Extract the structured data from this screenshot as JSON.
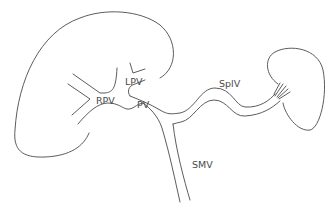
{
  "diagram": {
    "labels": {
      "rpv": "RPV",
      "lpv": "LPV",
      "pv": "PV",
      "splv": "SplV",
      "smv": "SMV"
    },
    "colors": {
      "stroke": "#4a4a4a",
      "background": "#ffffff"
    }
  }
}
